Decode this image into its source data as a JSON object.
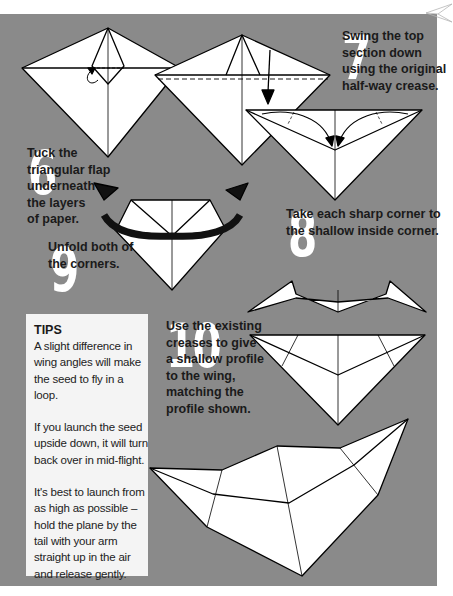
{
  "page": {
    "background": "#ffffff",
    "panel_color": "#8a8a8a"
  },
  "steps": [
    {
      "number": "6",
      "lines": [
        "Tuck the",
        "triangular flap",
        "underneath",
        "the layers",
        "of paper."
      ]
    },
    {
      "number": "7",
      "lines": [
        "Swing the top",
        "section down",
        "using the original",
        "half-way crease."
      ]
    },
    {
      "number": "8",
      "lines": [
        "Take each sharp corner to",
        "the shallow inside corner."
      ]
    },
    {
      "number": "9",
      "lines": [
        "Unfold both of",
        "the corners."
      ]
    },
    {
      "number": "10",
      "lines": [
        "Use the existing",
        "creases to give",
        "a shallow profile",
        "to the wing,",
        "matching the",
        "profile shown."
      ]
    }
  ],
  "tips": {
    "title": "TIPS",
    "paragraphs": [
      "A slight difference in wing angles will make the seed to fly in a loop.",
      "If you launch the seed upside down, it will turn back over in mid-flight.",
      "It's best to launch from as high as possible – hold the plane by the tail with your arm straight up in the air and release gently."
    ]
  },
  "icons": {
    "corner": "paper-plane-icon"
  }
}
